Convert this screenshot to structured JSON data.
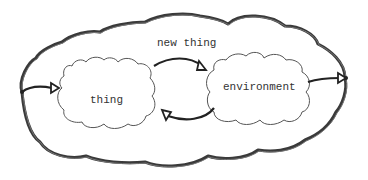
{
  "diagram": {
    "type": "hand-drawn cloud diagram",
    "outer_cloud": {
      "label": "new thing"
    },
    "inner_clouds": [
      {
        "id": "thing",
        "label": "thing"
      },
      {
        "id": "environment",
        "label": "environment"
      }
    ],
    "arrows": [
      {
        "from": "outer-left-edge",
        "to": "thing"
      },
      {
        "from": "thing",
        "to": "environment"
      },
      {
        "from": "environment",
        "to": "thing"
      },
      {
        "from": "environment",
        "to": "outer-right-edge"
      }
    ],
    "colors": {
      "stroke": "#333333",
      "background": "#ffffff"
    }
  }
}
